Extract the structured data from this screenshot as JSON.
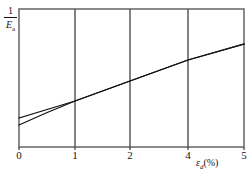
{
  "chart_data": {
    "type": "line",
    "title": "",
    "subtitle": "",
    "xlabel": "ε",
    "xlabel_sub": "d",
    "xlabel_unit": "(%)",
    "ylabel_numerator": "1",
    "ylabel_denominator": "E",
    "ylabel_denominator_sub": "a",
    "grid": "vertical-only",
    "legend": "none",
    "xlim": [
      0,
      5
    ],
    "ylim": [
      0,
      1
    ],
    "xticks": [
      {
        "label": "0",
        "px": 19
      },
      {
        "label": "1",
        "px": 75
      },
      {
        "label": "2",
        "px": 130
      },
      {
        "label": "4",
        "px": 188
      },
      {
        "label": "5",
        "px": 244
      }
    ],
    "yticks": [],
    "gridlines_px": [
      75,
      130,
      188
    ],
    "axis_frame_px": {
      "left": 19,
      "right": 244,
      "top": 9,
      "bottom": 147
    },
    "series": [
      {
        "name": "upper-branch",
        "points_px": [
          [
            19,
            118
          ],
          [
            75,
            101
          ],
          [
            130,
            81
          ],
          [
            188,
            60
          ],
          [
            244,
            44
          ]
        ],
        "values": [
          {
            "x": 0.0,
            "y": 0.21
          },
          {
            "x": 1.0,
            "y": 0.33
          },
          {
            "x": 2.0,
            "y": 0.48
          },
          {
            "x": 4.0,
            "y": 0.63
          },
          {
            "x": 5.0,
            "y": 0.75
          }
        ]
      },
      {
        "name": "lower-branch",
        "points_px": [
          [
            19,
            125
          ],
          [
            46,
            113
          ],
          [
            75,
            101
          ],
          [
            130,
            81
          ],
          [
            188,
            60
          ],
          [
            244,
            44
          ]
        ],
        "values": [
          {
            "x": 0.0,
            "y": 0.16
          },
          {
            "x": 0.5,
            "y": 0.25
          },
          {
            "x": 1.0,
            "y": 0.33
          },
          {
            "x": 2.0,
            "y": 0.48
          },
          {
            "x": 4.0,
            "y": 0.63
          },
          {
            "x": 5.0,
            "y": 0.75
          }
        ]
      }
    ]
  }
}
